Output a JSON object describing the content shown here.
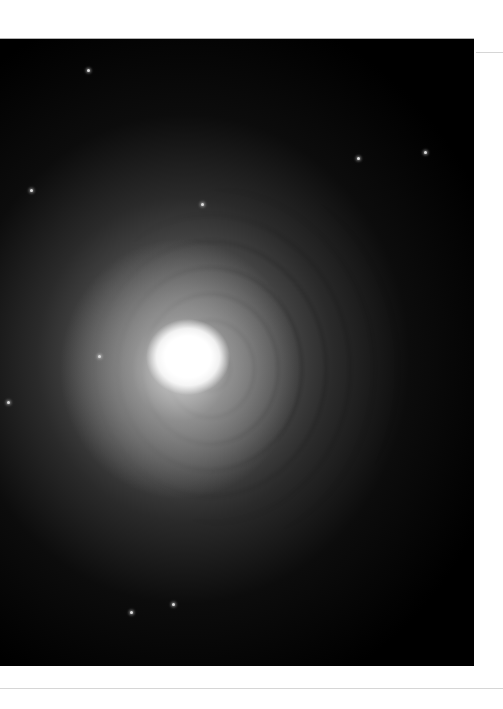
{
  "image": {
    "subject": "astronomical image of a bright galaxy core with concentric shell structure",
    "colors": {
      "background": "#000000",
      "core": "#ffffff",
      "page": "#ffffff"
    },
    "stars": [
      {
        "x": 87,
        "y": 30
      },
      {
        "x": 201,
        "y": 164
      },
      {
        "x": 357,
        "y": 118
      },
      {
        "x": 98,
        "y": 316
      },
      {
        "x": 30,
        "y": 150
      },
      {
        "x": 7,
        "y": 362
      },
      {
        "x": 424,
        "y": 112
      },
      {
        "x": 172,
        "y": 564
      },
      {
        "x": 130,
        "y": 572
      }
    ]
  }
}
